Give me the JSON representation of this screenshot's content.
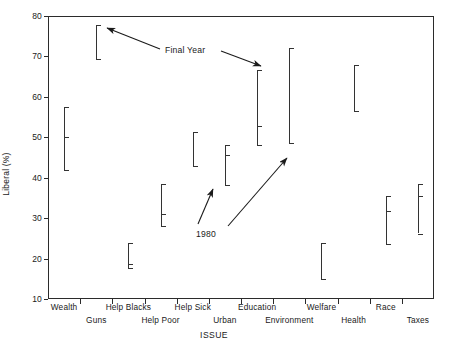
{
  "chart_data": {
    "type": "range",
    "title": "",
    "xlabel": "ISSUE",
    "ylabel": "Liberal (%)",
    "ylim": [
      10,
      80
    ],
    "yticks": [
      10,
      20,
      30,
      40,
      50,
      60,
      70,
      80
    ],
    "grid": false,
    "legend": "none",
    "categories": [
      "Wealth",
      "Guns",
      "Help Blacks",
      "Help Poor",
      "Help Sick",
      "Urban",
      "Education",
      "Environment",
      "Welfare",
      "Health",
      "Race",
      "Taxes"
    ],
    "annotations": [
      {
        "text": "Final Year",
        "note": "two arrows pointing to tops of segments"
      },
      {
        "text": "1980",
        "note": "two arrows pointing to 1980 tick marks"
      }
    ],
    "series": [
      {
        "name": "Wealth",
        "low": 41.8,
        "high": 57.6,
        "value_1980": 50.0
      },
      {
        "name": "Guns",
        "low": 69.3,
        "high": 77.7,
        "value_1980": 77.7
      },
      {
        "name": "Help Blacks",
        "low": 17.7,
        "high": 23.8,
        "value_1980": 18.6
      },
      {
        "name": "Help Poor",
        "low": 28.0,
        "high": 38.4,
        "value_1980": 31.1
      },
      {
        "name": "Help Sick",
        "low": 42.8,
        "high": 51.3,
        "value_1980": 51.3
      },
      {
        "name": "Urban",
        "low": 38.3,
        "high": 48.0,
        "value_1980": 45.6
      },
      {
        "name": "Education",
        "low": 48.2,
        "high": 66.6,
        "value_1980": 52.8
      },
      {
        "name": "Environment",
        "low": 48.6,
        "high": 72.0,
        "value_1980": 48.6
      },
      {
        "name": "Welfare",
        "low": 15.0,
        "high": 23.9,
        "value_1980": 23.9
      },
      {
        "name": "Health",
        "low": 56.4,
        "high": 68.0,
        "value_1980": 68.0
      },
      {
        "name": "Race",
        "low": 23.6,
        "high": 35.6,
        "value_1980": 31.8
      },
      {
        "name": "Taxes",
        "low": 26.2,
        "high": 38.5,
        "value_1980": 35.6
      }
    ]
  },
  "axis": {
    "y_title": "Liberal (%)",
    "x_title": "ISSUE",
    "y_labels": [
      "80",
      "70",
      "60",
      "50",
      "40",
      "30",
      "20",
      "10"
    ]
  },
  "x_labels": [
    {
      "label": "Wealth",
      "row": 0
    },
    {
      "label": "Guns",
      "row": 1
    },
    {
      "label": "Help Blacks",
      "row": 0
    },
    {
      "label": "Help Poor",
      "row": 1
    },
    {
      "label": "Help Sick",
      "row": 0
    },
    {
      "label": "Urban",
      "row": 1
    },
    {
      "label": "Education",
      "row": 0
    },
    {
      "label": "Environment",
      "row": 1
    },
    {
      "label": "Welfare",
      "row": 0
    },
    {
      "label": "Health",
      "row": 1
    },
    {
      "label": "Race",
      "row": 0
    },
    {
      "label": "Taxes",
      "row": 1
    }
  ],
  "annotations": {
    "final_year": "Final Year",
    "year_1980": "1980"
  },
  "colors": {
    "line": "#333333",
    "axis": "#2b2b2b",
    "background": "#ffffff"
  }
}
